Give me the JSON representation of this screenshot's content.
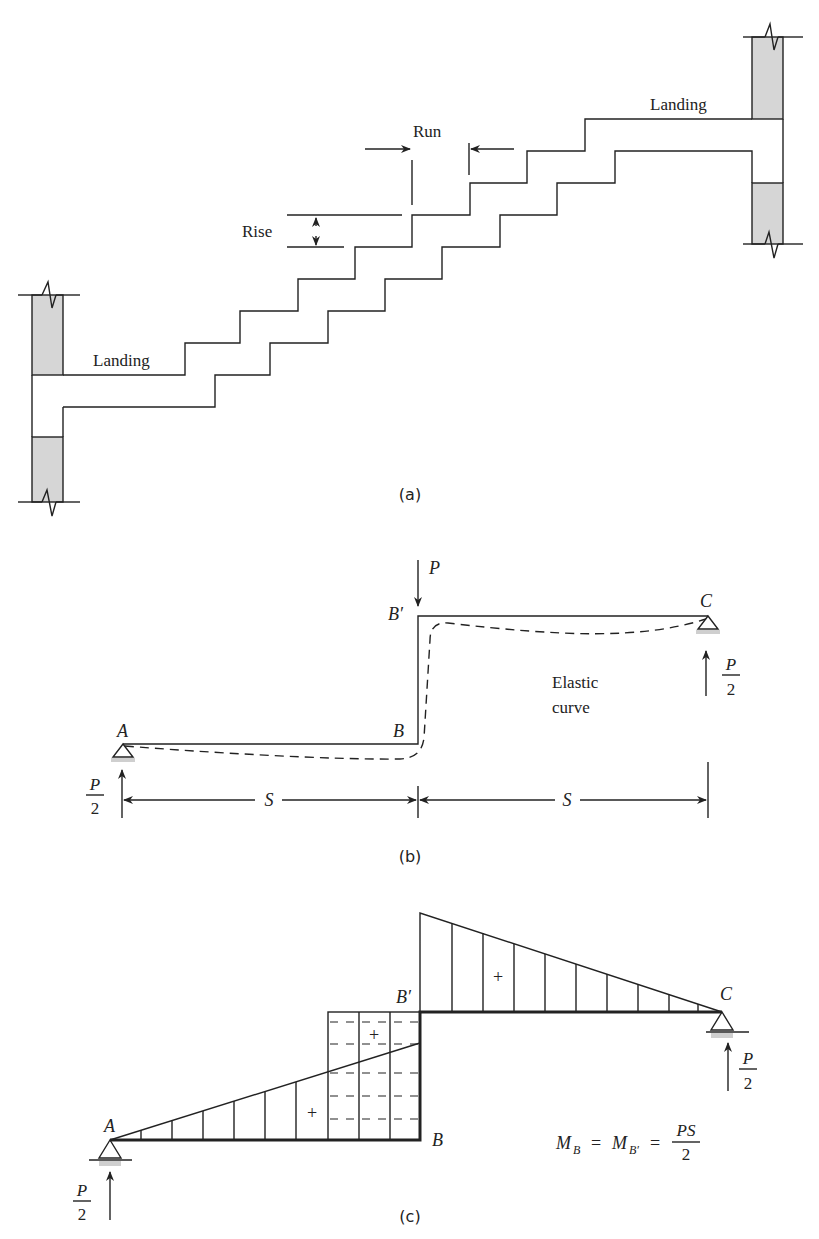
{
  "figure_a": {
    "caption": "(a)",
    "labels": {
      "landing_upper": "Landing",
      "landing_lower": "Landing",
      "run": "Run",
      "rise": "Rise"
    }
  },
  "figure_b": {
    "caption": "(b)",
    "labels": {
      "load": "P",
      "point_a": "A",
      "point_b": "B",
      "point_b_prime": "B′",
      "point_c": "C",
      "elastic_curve_line1": "Elastic",
      "elastic_curve_line2": "curve",
      "span_left": "S",
      "span_right": "S",
      "reaction_left_num": "P",
      "reaction_left_den": "2",
      "reaction_right_num": "P",
      "reaction_right_den": "2"
    }
  },
  "figure_c": {
    "caption": "(c)",
    "labels": {
      "point_a": "A",
      "point_b": "B",
      "point_b_prime": "B′",
      "point_c": "C",
      "sign_upper": "+",
      "sign_rect": "+",
      "sign_lower": "+",
      "reaction_left_num": "P",
      "reaction_left_den": "2",
      "reaction_right_num": "P",
      "reaction_right_den": "2"
    },
    "equation": {
      "m": "M",
      "sub_b": "B",
      "eq1": "=",
      "m2": "M",
      "sub_b_prime": "B′",
      "eq2": "=",
      "num": "PS",
      "den": "2"
    }
  }
}
